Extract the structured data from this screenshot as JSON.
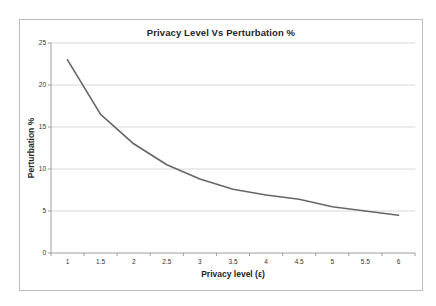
{
  "chart_data": {
    "type": "line",
    "title": "Privacy Level Vs Perturbation %",
    "xlabel": "Privacy level (ε)",
    "ylabel": "Perturbation %",
    "x": [
      "1",
      "1.5",
      "2",
      "2.5",
      "3",
      "3.5",
      "4",
      "4.5",
      "5",
      "5.5",
      "6"
    ],
    "series": [
      {
        "name": "Perturbation %",
        "values": [
          23,
          16.5,
          13,
          10.5,
          8.8,
          7.6,
          6.9,
          6.4,
          5.5,
          5,
          4.5
        ]
      }
    ],
    "ylim": [
      0,
      25
    ],
    "yticks": [
      0,
      5,
      10,
      15,
      20,
      25
    ],
    "grid": "horizontal",
    "legend": "none",
    "colors": {
      "line": "#666666",
      "gridline": "#d8d8d8",
      "axis": "#9e9e9e",
      "frame_border": "#bfbfbf",
      "text": "#333333"
    }
  }
}
